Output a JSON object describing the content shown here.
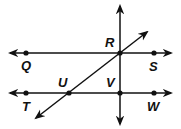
{
  "diagram": {
    "type": "geometry-lines",
    "lines": [
      {
        "name": "line-QS",
        "through": [
          "Q",
          "R",
          "S"
        ]
      },
      {
        "name": "line-TW",
        "through": [
          "T",
          "U",
          "V",
          "W"
        ]
      },
      {
        "name": "vertical-line",
        "through": [
          "R",
          "V"
        ]
      },
      {
        "name": "diagonal-line",
        "through": [
          "U",
          "R"
        ]
      }
    ],
    "points": {
      "Q": {
        "label": "Q"
      },
      "R": {
        "label": "R"
      },
      "S": {
        "label": "S"
      },
      "T": {
        "label": "T"
      },
      "U": {
        "label": "U"
      },
      "V": {
        "label": "V"
      },
      "W": {
        "label": "W"
      }
    },
    "color": "#111111"
  }
}
